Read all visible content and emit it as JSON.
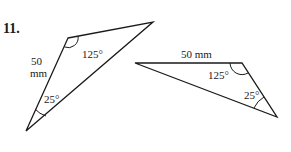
{
  "problem": {
    "number": "11."
  },
  "triangles": [
    {
      "id": "left",
      "vertices": {
        "top_left": [
          68,
          38
        ],
        "top_right": [
          153,
          22
        ],
        "bottom": [
          26,
          131
        ]
      },
      "side_label": {
        "line1": "50",
        "line2": "mm"
      },
      "angles": [
        {
          "vertex": "top_left",
          "label": "125°"
        },
        {
          "vertex": "bottom",
          "label": "25°"
        }
      ]
    },
    {
      "id": "right",
      "vertices": {
        "left": [
          135,
          63
        ],
        "top_right": [
          242,
          63
        ],
        "bottom": [
          277,
          117
        ]
      },
      "side_label": {
        "text": "50 mm"
      },
      "angles": [
        {
          "vertex": "top_right",
          "label": "125°"
        },
        {
          "vertex": "bottom",
          "label": "25°"
        }
      ]
    }
  ],
  "colors": {
    "ink": "#1a1a1a",
    "background": "#ffffff"
  }
}
